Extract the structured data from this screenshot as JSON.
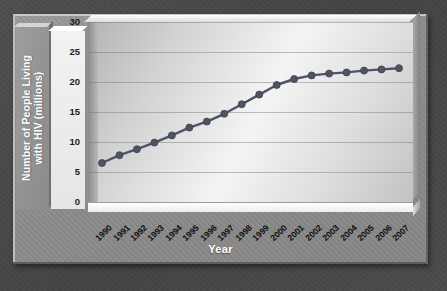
{
  "chart_data": {
    "type": "line",
    "title": "",
    "xlabel": "Year",
    "ylabel": "Number of People Living\nwith HIV (millions)",
    "categories": [
      "1990",
      "1991",
      "1992",
      "1993",
      "1994",
      "1995",
      "1996",
      "1997",
      "1998",
      "1999",
      "2000",
      "2001",
      "2002",
      "2003",
      "2004",
      "2005",
      "2006",
      "2007"
    ],
    "values": [
      6.5,
      7.8,
      8.8,
      9.9,
      11.1,
      12.4,
      13.4,
      14.7,
      16.3,
      17.9,
      19.5,
      20.5,
      21.1,
      21.4,
      21.6,
      21.9,
      22.1,
      22.3
    ],
    "series": [
      {
        "name": "People living with HIV",
        "values": [
          6.5,
          7.8,
          8.8,
          9.9,
          11.1,
          12.4,
          13.4,
          14.7,
          16.3,
          17.9,
          19.5,
          20.5,
          21.1,
          21.4,
          21.6,
          21.9,
          22.1,
          22.3
        ]
      }
    ],
    "ylim": [
      0,
      30
    ],
    "yticks": [
      "0",
      "5",
      "10",
      "15",
      "20",
      "25",
      "30"
    ],
    "ytick_values": [
      0,
      5,
      10,
      15,
      20,
      25,
      30
    ],
    "grid": true,
    "legend": "none",
    "marker": "circle",
    "line_color": "#4d5463",
    "marker_color": "#4d5463"
  },
  "axes": {
    "y_title_line1": "Number of People Living",
    "y_title_line2": "with HIV (millions)",
    "x_title": "Year"
  },
  "colors": {
    "backdrop": "#474747",
    "panel": "#8d8d8d",
    "plot_light": "#f4f4f4",
    "series": "#4d5463",
    "tick_text": "#1c1c1c",
    "title_text": "#ffffff",
    "gridline": "#6e6e6e"
  }
}
